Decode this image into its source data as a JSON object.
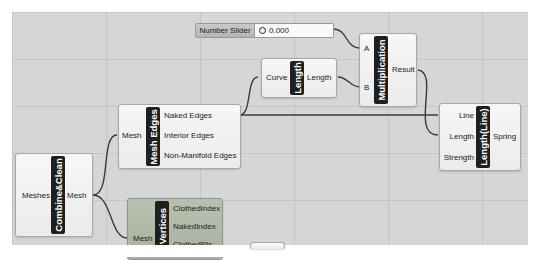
{
  "slider": {
    "label": "Number Slider",
    "value": "0.000"
  },
  "nodes": {
    "multiplication": {
      "title": "Multiplication",
      "inputs": [
        "A",
        "B"
      ],
      "outputs": [
        "Result"
      ]
    },
    "length": {
      "title": "Length",
      "inputs": [
        "Curve"
      ],
      "outputs": [
        "Length"
      ]
    },
    "mesh_edges": {
      "title": "Mesh Edges",
      "inputs": [
        "Mesh"
      ],
      "outputs": [
        "Naked Edges",
        "Interior Edges",
        "Non-Manifold Edges"
      ]
    },
    "length_line": {
      "title": "Length(Line)",
      "inputs": [
        "Line",
        "Length",
        "Strength"
      ],
      "outputs": [
        "Spring"
      ]
    },
    "combine_clean": {
      "title": "Combine&Clean",
      "inputs": [
        "Meshes"
      ],
      "outputs": [
        "Mesh"
      ]
    },
    "vertices": {
      "title": "dVertices",
      "inputs": [
        "Mesh"
      ],
      "outputs": [
        "ClothedIndex",
        "NakedIndex",
        "ClothedPts"
      ]
    }
  },
  "colors": {
    "canvas": "#d6d6d6",
    "node": "#f2f2f2",
    "band": "#1f1f1f",
    "selected_node": "#b0b8a8",
    "wire": "#3a3a3a"
  }
}
